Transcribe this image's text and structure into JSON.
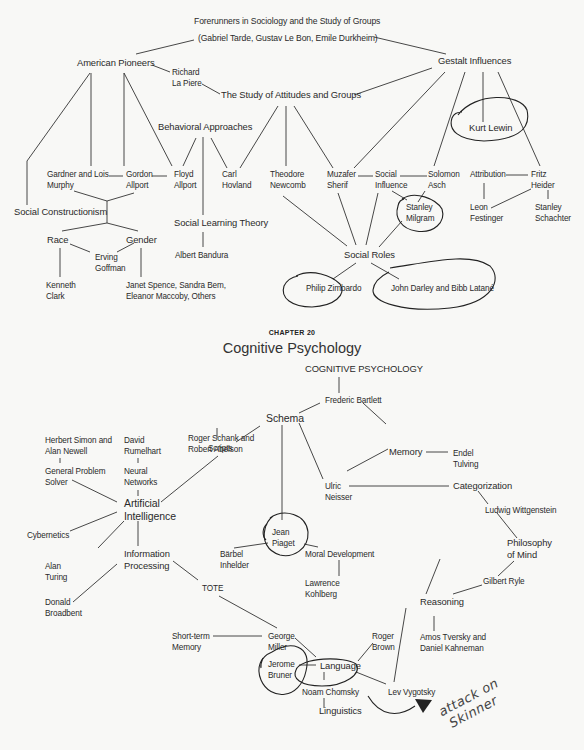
{
  "page": {
    "background": "#f8f8f6",
    "ink_color": "#2a2a2a",
    "annotation_color": "#333333"
  },
  "social_map": {
    "root_line1": "Forerunners in Sociology and the Study of Groups",
    "root_line2": "(Gabriel Tarde, Gustav Le Bon, Emile Durkheim)",
    "american_pioneers": "American Pioneers",
    "gestalt_influences": "Gestalt Influences",
    "richard_lapiere": [
      "Richard",
      "La Piere"
    ],
    "study_attitudes": "The Study of Attitudes and Groups",
    "behavioral_approaches": "Behavioral Approaches",
    "kurt_lewin": "Kurt Lewin",
    "murphy": [
      "Gardner and Lois",
      "Murphy"
    ],
    "gordon_allport": [
      "Gordon",
      "Allport"
    ],
    "floyd_allport": [
      "Floyd",
      "Allport"
    ],
    "carl_hovland": [
      "Carl",
      "Hovland"
    ],
    "theodore_newcomb": [
      "Theodore",
      "Newcomb"
    ],
    "muzafer_sherif": [
      "Muzafer",
      "Sherif"
    ],
    "social_influence": [
      "Social",
      "Influence"
    ],
    "solomon_asch": [
      "Solomon",
      "Asch"
    ],
    "attribution": "Attribution",
    "fritz_heider": [
      "Fritz",
      "Heider"
    ],
    "social_constructionism": "Social Constructionism",
    "social_learning_theory": "Social Learning Theory",
    "stanley_milgram": [
      "Stanley",
      "Milgram"
    ],
    "leon_festinger": [
      "Leon",
      "Festinger"
    ],
    "stanley_schachter": [
      "Stanley",
      "Schachter"
    ],
    "race": "Race",
    "gender": "Gender",
    "erving_goffman": [
      "Erving",
      "Goffman"
    ],
    "albert_bandura": "Albert Bandura",
    "social_roles": "Social Roles",
    "kenneth_clark": [
      "Kenneth",
      "Clark"
    ],
    "gender_names": [
      "Janet Spence, Sandra Bem,",
      "Eleanor Maccoby, Others"
    ],
    "philip_zimbardo": "Philip Zimbardo",
    "darley_latane": "John Darley and Bibb Latané"
  },
  "chapter": {
    "label": "CHAPTER 20",
    "title": "Cognitive Psychology"
  },
  "cognitive_map": {
    "root": "COGNITIVE PSYCHOLOGY",
    "frederic_bartlett": "Frederic Bartlett",
    "schema": "Schema",
    "memory": "Memory",
    "endel_tulving": [
      "Endel",
      "Tulving"
    ],
    "ulric_neisser": [
      "Ulric",
      "Neisser"
    ],
    "categorization": "Categorization",
    "ludwig_wittgenstein": "Ludwig Wittgenstein",
    "philosophy_of_mind": [
      "Philosophy",
      "of Mind"
    ],
    "gilbert_ryle": "Gilbert Ryle",
    "reasoning": "Reasoning",
    "tversky_kahneman": [
      "Amos Tversky and",
      "Daniel Kahneman"
    ],
    "simon_newell": [
      "Herbert Simon and",
      "Alan Newell"
    ],
    "general_problem_solver": [
      "General Problem",
      "Solver"
    ],
    "david_rumelhart": [
      "David",
      "Rumelhart"
    ],
    "neural_networks": [
      "Neural",
      "Networks"
    ],
    "schank_abelson": [
      "Roger Schank and",
      "Robert Abelson"
    ],
    "scripts": "Scripts",
    "artificial_intelligence": [
      "Artificial",
      "Intelligence"
    ],
    "cybernetics": "Cybernetics",
    "alan_turing": [
      "Alan",
      "Turing"
    ],
    "information_processing": [
      "Information",
      "Processing"
    ],
    "donald_broadbent": [
      "Donald",
      "Broadbent"
    ],
    "tote": "TOTE",
    "jean_piaget": [
      "Jean",
      "Piaget"
    ],
    "barbel_inhelder": [
      "Bärbel",
      "Inhelder"
    ],
    "moral_development": "Moral Development",
    "lawrence_kohlberg": [
      "Lawrence",
      "Kohlberg"
    ],
    "short_term_memory": [
      "Short-term",
      "Memory"
    ],
    "george_miller": [
      "George",
      "Miller"
    ],
    "roger_brown": [
      "Roger",
      "Brown"
    ],
    "jerome_bruner": [
      "Jerome",
      "Bruner"
    ],
    "language": "Language",
    "noam_chomsky": "Noam Chomsky",
    "lev_vygotsky": "Lev Vygotsky",
    "linguistics": "Linguistics"
  },
  "annotations": {
    "handwritten_note": [
      "attack on",
      "Skinner"
    ],
    "circled_items": [
      "Kurt Lewin",
      "Stanley Milgram",
      "Philip Zimbardo",
      "John Darley and Bibb Latané",
      "Jean Piaget",
      "Jerome Bruner",
      "Noam Chomsky"
    ]
  }
}
